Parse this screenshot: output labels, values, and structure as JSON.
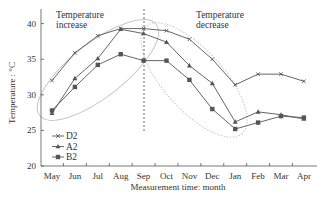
{
  "chart_data": {
    "type": "line",
    "title": "",
    "xlabel": "Measurement time: month",
    "ylabel": "Temperature : °C",
    "categories": [
      "May",
      "Jun",
      "Jul",
      "Aug",
      "Sep",
      "Oct",
      "Nov",
      "Dec",
      "Jan",
      "Feb",
      "Mar",
      "Apr"
    ],
    "ylim": [
      20,
      42
    ],
    "yticks": [
      20,
      25,
      30,
      35,
      40
    ],
    "grid": false,
    "legend_position": "lower left",
    "series": [
      {
        "name": "D2",
        "marker": "x-cross",
        "values": [
          32.0,
          35.9,
          38.3,
          39.3,
          39.3,
          39.0,
          37.8,
          35.0,
          31.4,
          32.9,
          32.9,
          31.9
        ]
      },
      {
        "name": "A2",
        "marker": "triangle",
        "values": [
          27.4,
          32.3,
          35.1,
          39.2,
          38.6,
          37.4,
          34.1,
          31.6,
          26.2,
          27.6,
          27.2,
          26.6
        ]
      },
      {
        "name": "B2",
        "marker": "square",
        "values": [
          27.8,
          31.1,
          34.2,
          35.7,
          34.8,
          34.8,
          32.1,
          28.0,
          25.2,
          26.1,
          27.0,
          26.8
        ]
      }
    ],
    "annotations": [
      {
        "text_lines": [
          "Temperature",
          "increase"
        ],
        "region": "May-Sep",
        "shape": "ellipse"
      },
      {
        "text_lines": [
          "Temperature",
          "decrease"
        ],
        "region": "Sep-Jan",
        "shape": "dotted ellipse"
      },
      {
        "type": "vertical dashed line",
        "at": "Sep"
      }
    ]
  },
  "labels": {
    "annot_left_1": "Temperature",
    "annot_left_2": "increase",
    "annot_right_1": "Temperature",
    "annot_right_2": "decrease",
    "xlabel": "Measurement time: month",
    "ylabel": "Temperature : °C"
  },
  "colors": {
    "line": "#555555",
    "axis": "#555555",
    "ellipse": "#c8c8c8",
    "text": "#333333"
  }
}
